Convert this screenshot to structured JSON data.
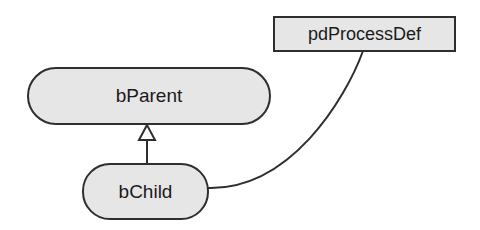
{
  "diagram": {
    "nodes": {
      "parent": {
        "label": "bParent",
        "shape": "rounded-rectangle"
      },
      "child": {
        "label": "bChild",
        "shape": "rounded-rectangle"
      },
      "procdef": {
        "label": "pdProcessDef",
        "shape": "rectangle"
      }
    },
    "edges": [
      {
        "from": "bChild",
        "to": "bParent",
        "type": "generalization",
        "arrow": "hollow-triangle"
      },
      {
        "from": "bChild",
        "to": "pdProcessDef",
        "type": "association",
        "arrow": "none"
      }
    ],
    "colors": {
      "node_fill": "#e6e6e6",
      "stroke": "#2e2e2e",
      "background": "#ffffff"
    }
  }
}
